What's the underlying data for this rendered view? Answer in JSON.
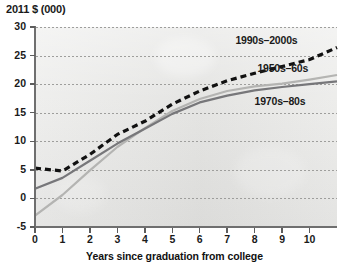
{
  "chart_data": {
    "type": "line",
    "title": "",
    "ylabel": "2011 $ (000)",
    "xlabel": "Years since graduation from college",
    "xlim": [
      0,
      11
    ],
    "ylim": [
      -5,
      30
    ],
    "xticks": [
      "0",
      "1",
      "2",
      "3",
      "4",
      "5",
      "6",
      "7",
      "8",
      "9",
      "10"
    ],
    "yticks": [
      "30",
      "25",
      "20",
      "15",
      "10",
      "5",
      "0",
      "-5"
    ],
    "grid": true,
    "legend_position": "inline-right",
    "x": [
      0,
      1,
      2,
      3,
      4,
      5,
      6,
      7,
      8,
      9,
      10,
      11
    ],
    "series": [
      {
        "name": "1990s-2000s",
        "label": "1990s–2000s",
        "style": "dashed",
        "color": "#111111",
        "values": [
          5.3,
          4.8,
          7.7,
          11.2,
          13.5,
          16.5,
          18.8,
          20.6,
          21.9,
          23.1,
          24.3,
          26.4
        ]
      },
      {
        "name": "1950s-60s",
        "label": "1950s–60s",
        "style": "solid",
        "color": "#b4b4b2",
        "values": [
          -3.0,
          0.6,
          4.9,
          9.0,
          12.3,
          15.3,
          17.4,
          18.8,
          19.6,
          20.1,
          20.8,
          21.6
        ]
      },
      {
        "name": "1970s-80s",
        "label": "1970s–80s",
        "style": "solid",
        "color": "#77777a",
        "values": [
          1.7,
          3.6,
          6.6,
          9.6,
          12.2,
          14.8,
          16.8,
          18.0,
          18.9,
          19.5,
          20.0,
          20.5
        ]
      }
    ],
    "annotations": [
      {
        "text": "1990s–2000s",
        "x": 7.3,
        "y": 27.6
      },
      {
        "text": "1950s–60s",
        "x": 8.1,
        "y": 22.7
      },
      {
        "text": "1970s–80s",
        "x": 8.0,
        "y": 16.9
      }
    ]
  }
}
